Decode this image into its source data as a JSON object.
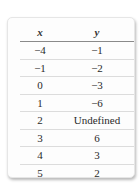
{
  "table": {
    "headers": [
      "x",
      "y"
    ],
    "rows": [
      [
        "−4",
        "−1"
      ],
      [
        "−1",
        "−2"
      ],
      [
        "0",
        "−3"
      ],
      [
        "1",
        "−6"
      ],
      [
        "2",
        "Undefined"
      ],
      [
        "3",
        "6"
      ],
      [
        "4",
        "3"
      ],
      [
        "5",
        "2"
      ]
    ]
  }
}
